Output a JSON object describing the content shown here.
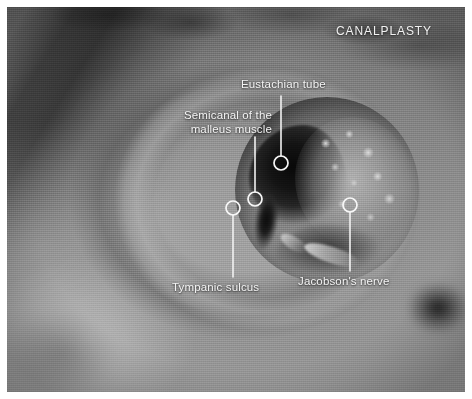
{
  "figure": {
    "kind": "surgical-anatomy-photograph",
    "title": "CANALPLASTY",
    "border_color": "#ffffff",
    "annotation_color": "#f4f4f4"
  },
  "annotations": [
    {
      "id": "eustachian-tube",
      "label": "Eustachian tube",
      "marker": {
        "x": 281,
        "y": 163,
        "r": 7
      },
      "leader": {
        "x1": 281,
        "y1": 96,
        "x2": 281,
        "y2": 156
      }
    },
    {
      "id": "semicanal-malleus-muscle",
      "label": "Semicanal of the\nmalleus muscle",
      "marker": {
        "x": 255,
        "y": 199,
        "r": 7
      },
      "leader": {
        "x1": 255,
        "y1": 137,
        "x2": 255,
        "y2": 192
      }
    },
    {
      "id": "tympanic-sulcus",
      "label": "Tympanic sulcus",
      "marker": {
        "x": 233,
        "y": 208,
        "r": 7
      },
      "leader": {
        "x1": 233,
        "y1": 215,
        "x2": 233,
        "y2": 277
      }
    },
    {
      "id": "jacobsons-nerve",
      "label": "Jacobson's nerve",
      "marker": {
        "x": 350,
        "y": 205,
        "r": 7
      },
      "leader": {
        "x1": 350,
        "y1": 212,
        "x2": 350,
        "y2": 271
      }
    }
  ]
}
